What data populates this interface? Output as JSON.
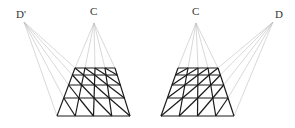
{
  "figures": [
    {
      "name": "left",
      "labels": [
        {
          "text": "D'",
          "x": 16,
          "y": 18
        },
        {
          "text": "C",
          "x": 90,
          "y": 15
        }
      ],
      "points": {
        "D": [
          24,
          22
        ],
        "C": [
          94,
          23
        ]
      },
      "grid": {
        "top": [
          75,
          115,
          68
        ],
        "bottom": [
          57,
          130,
          116
        ],
        "rows": [
          68,
          75,
          85,
          98,
          116
        ],
        "cols": 4,
        "diag": "left"
      }
    },
    {
      "name": "right",
      "labels": [
        {
          "text": "C",
          "x": 192,
          "y": 15
        },
        {
          "text": "D",
          "x": 275,
          "y": 18
        }
      ],
      "points": {
        "C": [
          196,
          23
        ],
        "D": [
          273,
          22
        ]
      },
      "grid": {
        "top": [
          178,
          218,
          68
        ],
        "bottom": [
          161,
          234,
          116
        ],
        "rows": [
          68,
          75,
          85,
          98,
          116
        ],
        "cols": 4,
        "diag": "right"
      }
    }
  ],
  "colors": {
    "rays": "#bdbdbd",
    "grid": "#1a1a1a",
    "text": "#333333"
  }
}
